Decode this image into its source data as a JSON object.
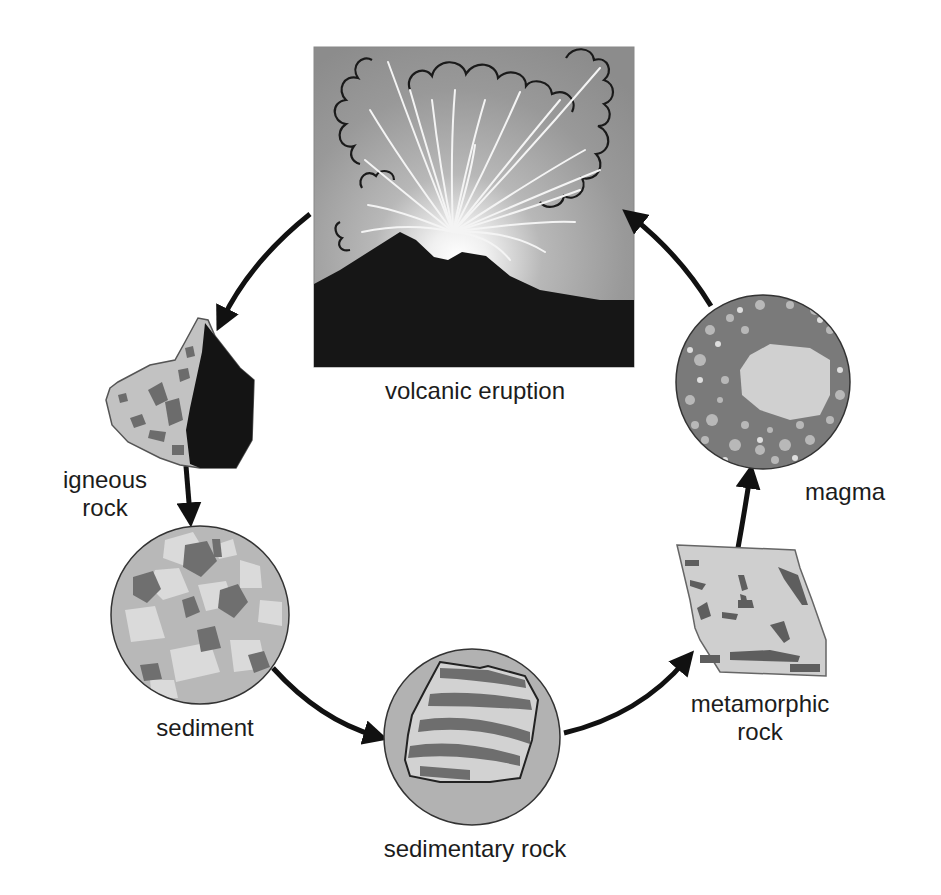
{
  "diagram": {
    "stages": [
      {
        "id": "volcanic-eruption",
        "label": "volcanic eruption"
      },
      {
        "id": "igneous-rock",
        "label_line1": "igneous",
        "label_line2": "rock"
      },
      {
        "id": "sediment",
        "label": "sediment"
      },
      {
        "id": "sedimentary-rock",
        "label": "sedimentary rock"
      },
      {
        "id": "metamorphic-rock",
        "label_line1": "metamorphic",
        "label_line2": "rock"
      },
      {
        "id": "magma",
        "label": "magma"
      }
    ],
    "flow": [
      {
        "from": "volcanic eruption",
        "to": "igneous rock"
      },
      {
        "from": "igneous rock",
        "to": "sediment"
      },
      {
        "from": "sediment",
        "to": "sedimentary rock"
      },
      {
        "from": "sedimentary rock",
        "to": "metamorphic rock"
      },
      {
        "from": "metamorphic rock",
        "to": "magma"
      },
      {
        "from": "magma",
        "to": "volcanic eruption"
      }
    ],
    "colors": {
      "arrow": "#111111",
      "rock_light": "#c8c8c8",
      "rock_mid": "#a8a8a8",
      "rock_dark": "#6e6e6e",
      "rock_black": "#141414",
      "circle_bg": "#b4b4b4",
      "sky_top": "#8a8a8a",
      "sky_glow": "#ffffff",
      "volcano": "#161616"
    }
  }
}
